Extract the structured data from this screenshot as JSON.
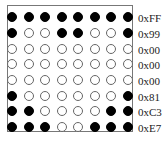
{
  "diagram": {
    "title": "",
    "grid": {
      "rows": 8,
      "cols": 8,
      "row_labels": [
        "0xFF",
        "0x99",
        "0x00",
        "0x00",
        "0x00",
        "0x81",
        "0xC3",
        "0xE7"
      ],
      "cells": [
        [
          1,
          1,
          1,
          1,
          1,
          1,
          1,
          1
        ],
        [
          1,
          0,
          0,
          1,
          1,
          0,
          0,
          1
        ],
        [
          0,
          0,
          0,
          0,
          0,
          0,
          0,
          0
        ],
        [
          0,
          0,
          0,
          0,
          0,
          0,
          0,
          0
        ],
        [
          0,
          0,
          0,
          0,
          0,
          0,
          0,
          0
        ],
        [
          1,
          0,
          0,
          0,
          0,
          0,
          0,
          1
        ],
        [
          1,
          1,
          0,
          0,
          0,
          0,
          1,
          1
        ],
        [
          1,
          1,
          1,
          0,
          0,
          1,
          1,
          1
        ]
      ],
      "col_x": [
        12,
        29,
        45,
        62,
        78,
        95,
        111,
        128
      ],
      "row_y": [
        17,
        33,
        49,
        64,
        80,
        96,
        111,
        127
      ]
    },
    "colors": {
      "on": "#000000",
      "off_fill": "#ffffff",
      "off_stroke": "#666666",
      "frame": "#777777"
    }
  }
}
